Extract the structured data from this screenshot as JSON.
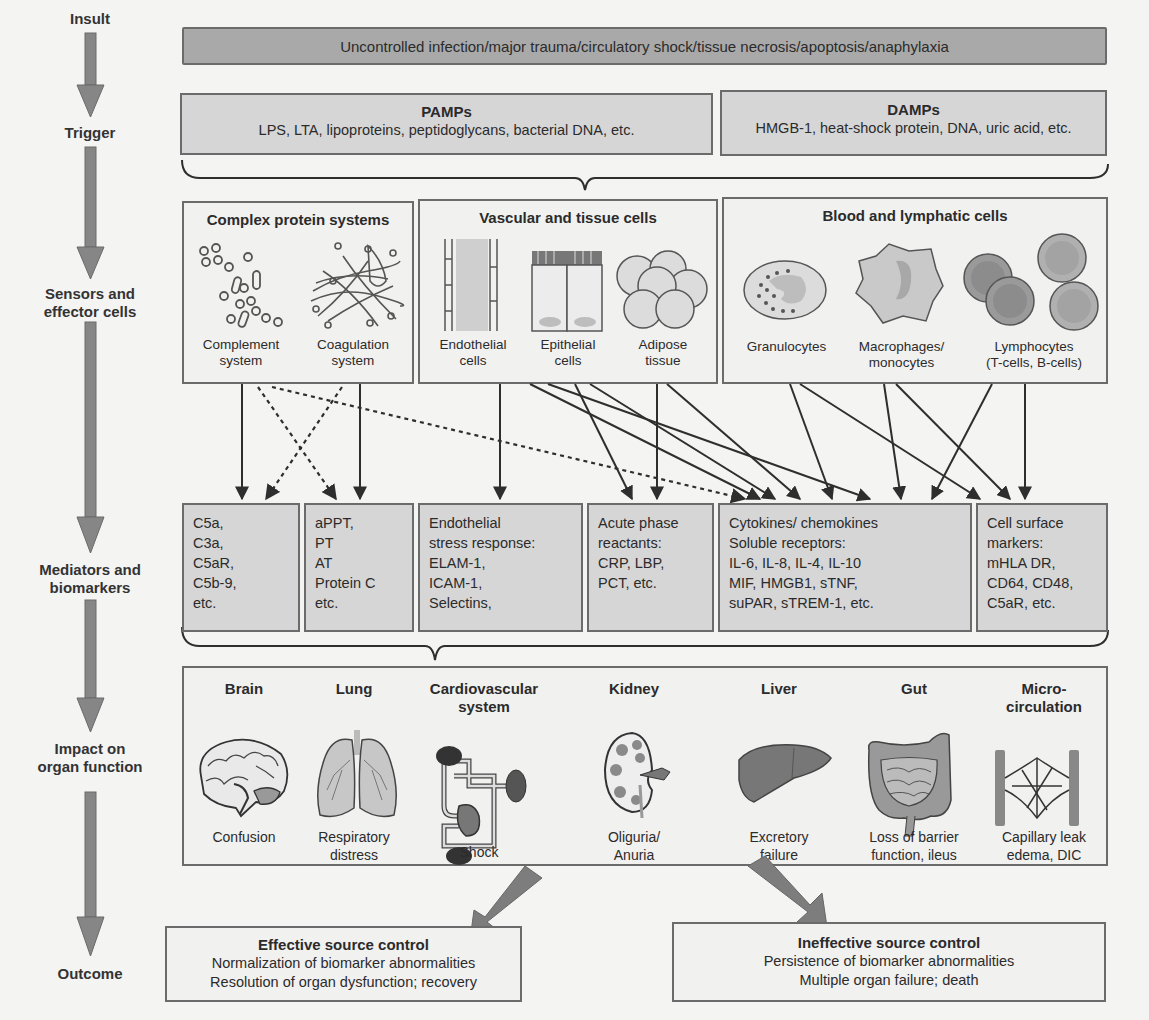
{
  "stages": [
    {
      "id": "insult",
      "label": "Insult"
    },
    {
      "id": "trigger",
      "label": "Trigger"
    },
    {
      "id": "sensors",
      "label": "Sensors and\neffector cells"
    },
    {
      "id": "mediators",
      "label": "Mediators and\nbiomarkers"
    },
    {
      "id": "impact",
      "label": "Impact on\norgan function"
    },
    {
      "id": "outcome",
      "label": "Outcome"
    }
  ],
  "insult": {
    "text": "Uncontrolled infection/major trauma/circulatory shock/tissue necrosis/apoptosis/anaphylaxia"
  },
  "trigger": {
    "pamps": {
      "title": "PAMPs",
      "text": "LPS, LTA, lipoproteins, peptidoglycans, bacterial DNA, etc."
    },
    "damps": {
      "title": "DAMPs",
      "text": "HMGB-1, heat-shock protein, DNA, uric acid, etc."
    }
  },
  "sensors": {
    "protein": {
      "title": "Complex protein systems",
      "items": [
        {
          "label": "Complement\nsystem",
          "icon": "complement-icon"
        },
        {
          "label": "Coagulation\nsystem",
          "icon": "coagulation-icon"
        }
      ]
    },
    "vascular": {
      "title": "Vascular and tissue cells",
      "items": [
        {
          "label": "Endothelial\ncells",
          "icon": "endothelial-cells-icon"
        },
        {
          "label": "Epithelial\ncells",
          "icon": "epithelial-cells-icon"
        },
        {
          "label": "Adipose\ntissue",
          "icon": "adipose-tissue-icon"
        }
      ]
    },
    "blood": {
      "title": "Blood and lymphatic cells",
      "items": [
        {
          "label": "Granulocytes",
          "icon": "granulocyte-icon"
        },
        {
          "label": "Macrophages/\nmonocytes",
          "icon": "macrophage-icon"
        },
        {
          "label": "Lymphocytes\n(T-cells, B-cells)",
          "icon": "lymphocyte-icon"
        }
      ]
    }
  },
  "mediators": [
    {
      "id": "complement",
      "text": "C5a,\nC3a,\nC5aR,\nC5b-9,\netc."
    },
    {
      "id": "coagulation",
      "text": "aPPT,\nPT\nAT\nProtein C\netc."
    },
    {
      "id": "endothelial",
      "text": "Endothelial\nstress response:\nELAM-1,\nICAM-1,\nSelectins,"
    },
    {
      "id": "acute-phase",
      "text": "Acute phase\nreactants:\nCRP, LBP,\nPCT, etc."
    },
    {
      "id": "cytokines",
      "text": "Cytokines/ chemokines\nSoluble receptors:\nIL-6, IL-8, IL-4, IL-10\nMIF, HMGB1, sTNF,\nsuPAR, sTREM-1, etc."
    },
    {
      "id": "cell-surface",
      "text": "Cell surface\nmarkers:\nmHLA DR,\nCD64, CD48,\nC5aR, etc."
    }
  ],
  "organs": [
    {
      "name": "Brain",
      "effect": "Confusion",
      "icon": "brain-icon"
    },
    {
      "name": "Lung",
      "effect": "Respiratory\ndistress",
      "icon": "lung-icon"
    },
    {
      "name": "Cardiovascular\nsystem",
      "effect": "Shock",
      "icon": "cardiovascular-icon"
    },
    {
      "name": "Kidney",
      "effect": "Oliguria/\nAnuria",
      "icon": "kidney-icon"
    },
    {
      "name": "Liver",
      "effect": "Excretory\nfailure",
      "icon": "liver-icon"
    },
    {
      "name": "Gut",
      "effect": "Loss of barrier\nfunction, ileus",
      "icon": "gut-icon"
    },
    {
      "name": "Micro-\ncirculation",
      "effect": "Capillary leak\nedema, DIC",
      "icon": "microcirculation-icon"
    }
  ],
  "outcomes": {
    "effective": {
      "title": "Effective source control",
      "lines": [
        "Normalization of biomarker abnormalities",
        "Resolution of organ dysfunction; recovery"
      ]
    },
    "ineffective": {
      "title": "Ineffective source control",
      "lines": [
        "Persistence of biomarker abnormalities",
        "Multiple organ failure; death"
      ]
    }
  },
  "colors": {
    "background": "#f4f4f3",
    "box_fill": "#d6d6d6",
    "insult_fill": "#a9a9a9",
    "border": "#6b6b6b",
    "arrow": "#7d7d7d",
    "line": "#2e2e2e"
  }
}
